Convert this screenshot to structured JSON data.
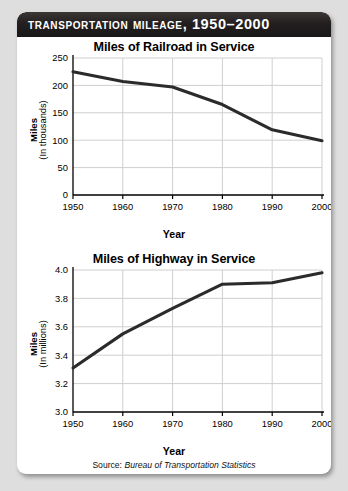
{
  "banner": {
    "title": "Transportation Mileage, 1950–2000"
  },
  "source": {
    "prefix": "Source:",
    "name": "Bureau of Transportation Statistics"
  },
  "colors": {
    "banner_bg": "#231f20",
    "card_bg": "#ffffff",
    "page_bg": "#dedede",
    "line": "#2b2b2b",
    "grid": "#cfcfcf",
    "axis": "#000000"
  },
  "chart_data": [
    {
      "type": "line",
      "title": "Miles of Railroad in Service",
      "xlabel": "Year",
      "ylabel": "Miles",
      "ylabel_sub": "(In thousands)",
      "categories": [
        "1950",
        "1960",
        "1970",
        "1980",
        "1990",
        "2000"
      ],
      "x": [
        1950,
        1960,
        1970,
        1980,
        1990,
        2000
      ],
      "values": [
        225,
        207,
        197,
        165,
        119,
        99
      ],
      "yticks": [
        "0",
        "50",
        "100",
        "150",
        "200",
        "250"
      ],
      "ytick_values": [
        0,
        50,
        100,
        150,
        200,
        250
      ],
      "ylim": [
        0,
        250
      ],
      "xlim": [
        1950,
        2000
      ],
      "grid": true,
      "legend": "none"
    },
    {
      "type": "line",
      "title": "Miles of Highway in Service",
      "xlabel": "Year",
      "ylabel": "Miles",
      "ylabel_sub": "(In millions)",
      "categories": [
        "1950",
        "1960",
        "1970",
        "1980",
        "1990",
        "2000"
      ],
      "x": [
        1950,
        1960,
        1970,
        1980,
        1990,
        2000
      ],
      "values": [
        3.31,
        3.55,
        3.73,
        3.9,
        3.91,
        3.98
      ],
      "yticks": [
        "3.0",
        "3.2",
        "3.4",
        "3.6",
        "3.8",
        "4.0"
      ],
      "ytick_values": [
        3.0,
        3.2,
        3.4,
        3.6,
        3.8,
        4.0
      ],
      "ylim": [
        3.0,
        4.0
      ],
      "xlim": [
        1950,
        2000
      ],
      "grid": true,
      "legend": "none"
    }
  ]
}
